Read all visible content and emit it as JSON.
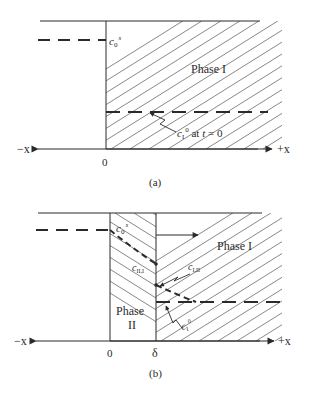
{
  "diagram_a": {
    "caption": "(a)",
    "axis": {
      "neg_label": "−x",
      "pos_label": "+x",
      "origin_label": "0"
    },
    "phase_label": "Phase I",
    "c0_label": {
      "base": "c",
      "sub": "0",
      "sup": "s"
    },
    "c1_label": {
      "base": "c",
      "sub": "I",
      "sup": "0",
      "suffix": " at ",
      "t": "t",
      "eq": " = 0"
    }
  },
  "diagram_b": {
    "caption": "(b)",
    "axis": {
      "neg_label": "−x",
      "pos_label": "+x",
      "origin_label": "0",
      "delta_label": "δ"
    },
    "phase1_label": "Phase I",
    "phase2_label_line1": "Phase",
    "phase2_label_line2": "II",
    "c0_label": {
      "base": "c",
      "sub": "0",
      "sup": "s"
    },
    "cII_label": {
      "base": "c",
      "sub": "II,I"
    },
    "cI_label": {
      "base": "c",
      "sub": "I,II"
    },
    "c1_label": {
      "base": "c",
      "sub": "I",
      "sup": "0"
    }
  },
  "colors": {
    "ink": "#2a2a2a",
    "hatch": "#555555",
    "background": "#ffffff"
  }
}
